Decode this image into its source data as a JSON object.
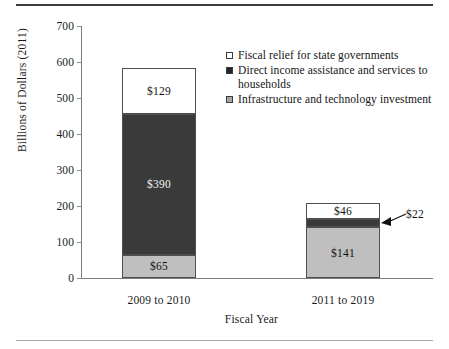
{
  "chart_data": {
    "type": "bar",
    "subtype": "stacked-bar",
    "title": "",
    "xlabel": "Fiscal Year",
    "ylabel": "Billions of Dollars (2011)",
    "categories": [
      "2009 to 2010",
      "2011 to 2019"
    ],
    "ylim": [
      0,
      700
    ],
    "yticks": [
      0,
      100,
      200,
      300,
      400,
      500,
      600,
      700
    ],
    "ytick_labels": [
      "0",
      "100",
      "200",
      "300",
      "400",
      "500",
      "600",
      "700"
    ],
    "grid": false,
    "legend_position": "upper-right-inside",
    "stack_order_bottom_to_top": [
      "Infrastructure and technology investment",
      "Direct income assistance and services to households",
      "Fiscal relief for state governments"
    ],
    "series": [
      {
        "name": "Infrastructure and technology investment",
        "color": "#bfbfbf",
        "values": [
          65,
          141
        ],
        "data_labels": [
          "$65",
          "$141"
        ]
      },
      {
        "name": "Direct income assistance and services to households",
        "color": "#3a3a3a",
        "values": [
          390,
          22
        ],
        "data_labels": [
          "$390",
          "$22"
        ]
      },
      {
        "name": "Fiscal relief for state governments",
        "color": "#ffffff",
        "values": [
          129,
          46
        ],
        "data_labels": [
          "$129",
          "$46"
        ]
      }
    ],
    "totals": [
      584,
      209
    ],
    "annotations": [
      {
        "text": "$22",
        "points_to": "Direct income assistance and services to households segment of 2011 to 2019 bar",
        "arrow": "left"
      }
    ]
  },
  "legend": {
    "items": [
      {
        "label": "Fiscal relief for state governments",
        "swatch": "white-square-icon",
        "color": "#ffffff"
      },
      {
        "label": "Direct income assistance and services to households",
        "swatch": "filled-dark-square-icon",
        "color": "#262626"
      },
      {
        "label": "Infrastructure and technology investment",
        "swatch": "gray-square-icon",
        "color": "#a6a6a6"
      }
    ]
  },
  "axes": {
    "y_title": "Billions of Dollars (2011)",
    "x_title": "Fiscal Year",
    "y_tick_labels": [
      "700",
      "600",
      "500",
      "400",
      "300",
      "200",
      "100",
      "0"
    ],
    "x_tick_labels": [
      "2009 to 2010",
      "2011 to 2019"
    ]
  },
  "bars": {
    "bar1": {
      "category": "2009 to 2010",
      "segments": [
        {
          "label": "$129",
          "value": 129,
          "fill": "#ffffff",
          "text_on_dark": false
        },
        {
          "label": "$390",
          "value": 390,
          "fill": "#3a3a3a",
          "text_on_dark": true
        },
        {
          "label": "$65",
          "value": 65,
          "fill": "#bfbfbf",
          "text_on_dark": false
        }
      ]
    },
    "bar2": {
      "category": "2011 to 2019",
      "segments": [
        {
          "label": "$46",
          "value": 46,
          "fill": "#ffffff",
          "text_on_dark": false
        },
        {
          "label": "$22",
          "value": 22,
          "fill": "#3a3a3a",
          "text_on_dark": true
        },
        {
          "label": "$141",
          "value": 141,
          "fill": "#bfbfbf",
          "text_on_dark": false
        }
      ]
    }
  },
  "callout": {
    "label": "$22"
  }
}
